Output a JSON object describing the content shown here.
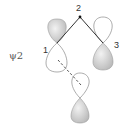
{
  "diagram": {
    "title_label": "ψ2",
    "atom_labels": {
      "atom1": "1",
      "atom2": "2",
      "atom3": "3"
    },
    "colors": {
      "bond": "#333333",
      "lobe_outline": "#8a8a8a",
      "lobe_fill": "#d8d8d8",
      "dashed_bond": "#555555"
    },
    "orbitals": [
      {
        "id": "p1",
        "atom": "1",
        "filled_lobe": "top"
      },
      {
        "id": "p3",
        "atom": "3",
        "filled_lobe": "bottom"
      },
      {
        "id": "p4",
        "atom": "",
        "filled_lobe": "bottom"
      }
    ]
  }
}
